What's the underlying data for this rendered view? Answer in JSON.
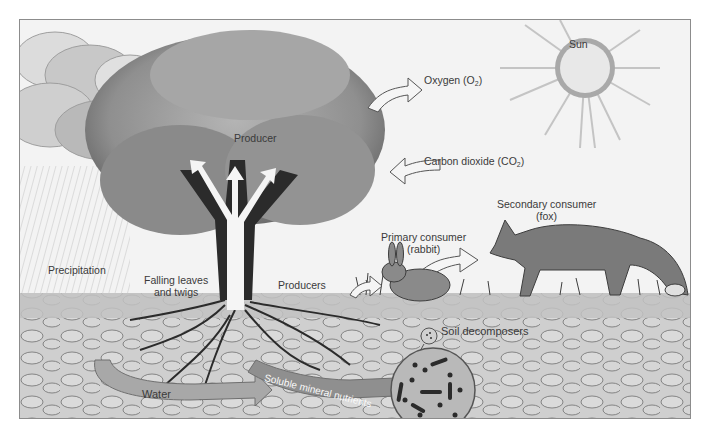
{
  "diagram": {
    "type": "ecosystem components",
    "labels": {
      "sun": "Sun",
      "oxygen": "Oxygen (O",
      "oxygen_sub": "2",
      "oxygen_close": ")",
      "co2": "Carbon dioxide (CO",
      "co2_sub": "2",
      "co2_close": ")",
      "producer": "Producer",
      "precipitation": "Precipitation",
      "falling_leaves_1": "Falling leaves",
      "falling_leaves_2": "and twigs",
      "producers": "Producers",
      "primary_consumer_1": "Primary consumer",
      "primary_consumer_2": "(rabbit)",
      "secondary_consumer_1": "Secondary consumer",
      "secondary_consumer_2": "(fox)",
      "soil_decomposers": "Soil decomposers",
      "water": "Water",
      "nutrients": "Soluble mineral nutrients"
    },
    "colors": {
      "sky": "#f2f2f2",
      "cloud": "#bdbdbd",
      "canopy": "#9a9a9a",
      "canopy_dark": "#5c5c5c",
      "trunk": "#2b2b2b",
      "soil": "#c9c9c9",
      "arrow": "#a8a8a8",
      "text": "#3a3a3a"
    }
  }
}
